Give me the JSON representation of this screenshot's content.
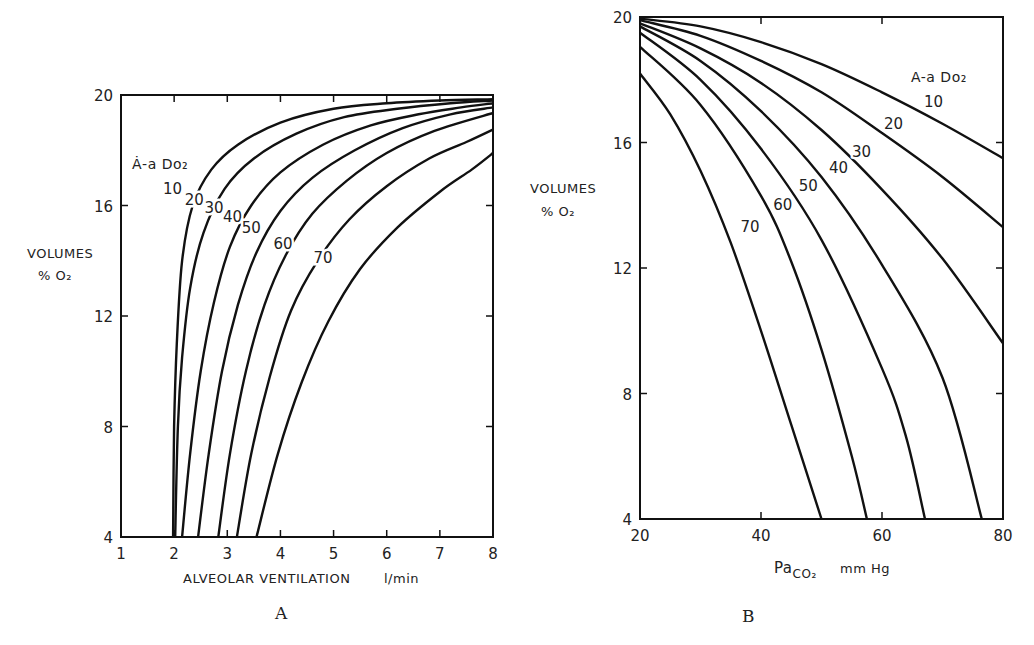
{
  "chart_data": [
    {
      "type": "line",
      "panel_label": "A",
      "title": "",
      "xlabel": "ALVEOLAR VENTILATION",
      "xlabel_unit": "l/min",
      "ylabel_line1": "VOLUMES",
      "ylabel_line2": "% O₂",
      "xlim": [
        1,
        8
      ],
      "ylim": [
        4,
        20
      ],
      "xticks": [
        1,
        2,
        3,
        4,
        5,
        6,
        7,
        8
      ],
      "yticks": [
        4,
        8,
        12,
        16,
        20
      ],
      "legend_title": "Ȧ-a Do₂",
      "grid": false,
      "series": [
        {
          "name": "10",
          "x": [
            1.98,
            2.0,
            2.05,
            2.15,
            2.35,
            2.7,
            3.2,
            4.0,
            5.0,
            6.0,
            7.0,
            8.0
          ],
          "y": [
            4,
            8,
            11,
            14,
            16,
            17.3,
            18.2,
            19.0,
            19.5,
            19.7,
            19.8,
            19.85
          ]
        },
        {
          "name": "20",
          "x": [
            2.02,
            2.07,
            2.15,
            2.3,
            2.55,
            2.95,
            3.5,
            4.3,
            5.2,
            6.2,
            7.2,
            8.0
          ],
          "y": [
            4,
            8,
            10.5,
            13,
            15,
            16.6,
            17.7,
            18.6,
            19.2,
            19.5,
            19.7,
            19.8
          ]
        },
        {
          "name": "30",
          "x": [
            2.15,
            2.3,
            2.5,
            2.75,
            3.05,
            3.45,
            4.0,
            4.8,
            5.7,
            6.6,
            7.4,
            8.0
          ],
          "y": [
            4,
            7,
            10,
            12.5,
            14.5,
            16,
            17.2,
            18.2,
            18.9,
            19.3,
            19.55,
            19.7
          ]
        },
        {
          "name": "40",
          "x": [
            2.45,
            2.65,
            2.9,
            3.2,
            3.55,
            4.0,
            4.6,
            5.4,
            6.3,
            7.2,
            8.0
          ],
          "y": [
            4,
            7,
            10,
            12.4,
            14.3,
            15.8,
            17.0,
            18.0,
            18.8,
            19.3,
            19.55
          ]
        },
        {
          "name": "50",
          "x": [
            2.83,
            3.05,
            3.35,
            3.7,
            4.1,
            4.6,
            5.25,
            6.0,
            6.9,
            8.0
          ],
          "y": [
            4,
            7,
            10,
            12.4,
            14.2,
            15.7,
            16.9,
            17.9,
            18.7,
            19.35
          ]
        },
        {
          "name": "60",
          "x": [
            3.18,
            3.45,
            3.8,
            4.2,
            4.7,
            5.3,
            6.0,
            6.8,
            7.5,
            8.0
          ],
          "y": [
            4,
            7,
            9.8,
            12.2,
            14.0,
            15.5,
            16.7,
            17.7,
            18.3,
            18.75
          ]
        },
        {
          "name": "70",
          "x": [
            3.55,
            3.95,
            4.4,
            4.9,
            5.5,
            6.2,
            7.0,
            7.6,
            8.0
          ],
          "y": [
            4,
            7,
            9.6,
            11.8,
            13.7,
            15.2,
            16.5,
            17.3,
            17.9
          ]
        }
      ]
    },
    {
      "type": "line",
      "panel_label": "B",
      "title": "",
      "xlabel": "Pa",
      "xlabel_sub": "CO₂",
      "xlabel_unit": "mm Hg",
      "ylabel_line1": "VOLUMES",
      "ylabel_line2": "% O₂",
      "xlim": [
        20,
        80
      ],
      "ylim": [
        4,
        20
      ],
      "xticks": [
        20,
        40,
        60,
        80
      ],
      "yticks": [
        4,
        8,
        12,
        16,
        20
      ],
      "legend_title": "A-a Do₂",
      "grid": false,
      "series": [
        {
          "name": "10",
          "x": [
            20,
            30,
            40,
            50,
            60,
            70,
            80
          ],
          "y": [
            19.95,
            19.7,
            19.2,
            18.5,
            17.6,
            16.6,
            15.5
          ]
        },
        {
          "name": "20",
          "x": [
            20,
            30,
            40,
            50,
            60,
            70,
            80
          ],
          "y": [
            19.9,
            19.4,
            18.6,
            17.6,
            16.3,
            14.9,
            13.3
          ]
        },
        {
          "name": "30",
          "x": [
            20,
            30,
            40,
            50,
            60,
            70,
            80
          ],
          "y": [
            19.8,
            19.0,
            17.9,
            16.4,
            14.5,
            12.3,
            9.6
          ]
        },
        {
          "name": "40",
          "x": [
            20,
            30,
            40,
            50,
            60,
            70,
            76.5
          ],
          "y": [
            19.7,
            18.6,
            17.0,
            14.9,
            12.1,
            8.5,
            4
          ]
        },
        {
          "name": "50",
          "x": [
            20,
            30,
            40,
            50,
            60,
            64,
            67.1
          ],
          "y": [
            19.5,
            18.0,
            15.8,
            12.9,
            8.8,
            6.6,
            4
          ]
        },
        {
          "name": "60",
          "x": [
            20,
            30,
            40,
            45,
            50,
            55,
            57.5
          ],
          "y": [
            19.05,
            17.2,
            14.3,
            12.2,
            9.4,
            6.0,
            4
          ]
        },
        {
          "name": "70",
          "x": [
            20,
            25,
            30,
            35,
            40,
            45,
            50
          ],
          "y": [
            18.2,
            16.9,
            15.1,
            12.8,
            10.0,
            7.0,
            4
          ]
        }
      ]
    }
  ]
}
